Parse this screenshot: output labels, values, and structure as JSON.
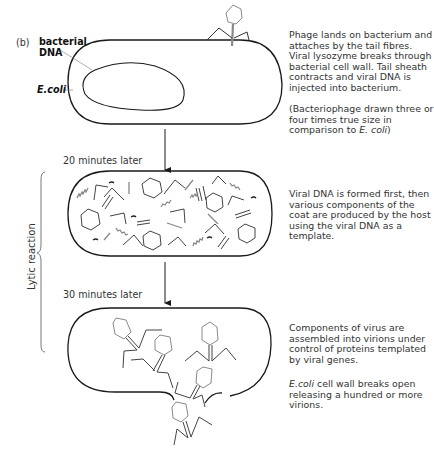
{
  "figure": {
    "panel_label": "(b)",
    "labels": {
      "bacterial_dna_line1": "bacterial",
      "bacterial_dna_line2": "DNA",
      "ecoli": "E.coli"
    },
    "timepoints": [
      {
        "label": "20 minutes later"
      },
      {
        "label": "30 minutes later"
      }
    ],
    "side_bracket_label": "Lytic reaction",
    "descriptions": [
      {
        "text": "Phage lands on bacterium and attaches by the tail fibres. Viral lysozyme breaks through bacterial cell wall. Tail sheath contracts and viral DNA is injected into bacterium."
      },
      {
        "text_prefix": "(Bacteriophage drawn three or four times true size in comparison to ",
        "italic": "E. coli",
        "text_suffix": ")"
      },
      {
        "text": "Viral DNA is formed first, then various components of the coat are produced by the host using the viral DNA as a template."
      },
      {
        "text": "Components of virus are assembled into virions under control of proteins templated by viral genes."
      },
      {
        "italic": "E.coli",
        "text_suffix": " cell wall breaks open releasing a hundred or more virions."
      }
    ],
    "stages": [
      {
        "name": "attachment-and-injection"
      },
      {
        "name": "synthesis-of-components"
      },
      {
        "name": "assembly-and-lysis"
      }
    ],
    "colors": {
      "outline": "#1a1a1a",
      "phage": "#8a8a8a",
      "text": "#333333"
    }
  }
}
